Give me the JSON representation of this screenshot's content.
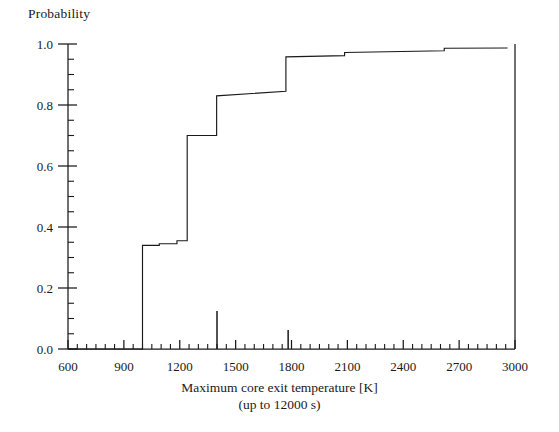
{
  "chart_data": {
    "type": "line",
    "title": "",
    "ylabel": "Probability",
    "xlabel": "Maximum core exit temperature [K]",
    "xlabel_sub": "(up to 12000 s)",
    "xlim": [
      600,
      3000
    ],
    "ylim": [
      0.0,
      1.0
    ],
    "grid": false,
    "legend": null,
    "x_major_ticks": [
      600,
      900,
      1200,
      1500,
      1800,
      2100,
      2400,
      2700,
      3000
    ],
    "x_major_tick_labels": [
      "600",
      "900",
      "1200",
      "1500",
      "1800",
      "2100",
      "2400",
      "2700",
      "3000"
    ],
    "x_minor_tick_step": 50,
    "y_major_ticks": [
      0.0,
      0.2,
      0.4,
      0.6,
      0.8,
      1.0
    ],
    "y_major_tick_labels": [
      "0.0",
      "0.2",
      "0.4",
      "0.6",
      "0.8",
      "1.0"
    ],
    "y_minor_tick_step": 0.05,
    "series": [
      {
        "name": "Cumulative distribution (ECDF)",
        "style": "step",
        "color": "#1a1a1a",
        "points": [
          [
            600,
            0.0
          ],
          [
            1000,
            0.0
          ],
          [
            1000,
            0.34
          ],
          [
            1090,
            0.34
          ],
          [
            1090,
            0.345
          ],
          [
            1185,
            0.345
          ],
          [
            1185,
            0.355
          ],
          [
            1240,
            0.355
          ],
          [
            1240,
            0.7
          ],
          [
            1398,
            0.7
          ],
          [
            1398,
            0.83
          ],
          [
            1770,
            0.845
          ],
          [
            1770,
            0.958
          ],
          [
            2085,
            0.962
          ],
          [
            2085,
            0.972
          ],
          [
            2620,
            0.978
          ],
          [
            2620,
            0.986
          ],
          [
            2960,
            0.987
          ]
        ]
      },
      {
        "name": "Impulse markers",
        "style": "spike",
        "color": "#1a1a1a",
        "spikes": [
          [
            1400,
            0.125
          ],
          [
            1782,
            0.062
          ]
        ]
      }
    ],
    "annotations": []
  },
  "colors": {
    "ink": "#1a1a1a",
    "background": "#ffffff"
  }
}
